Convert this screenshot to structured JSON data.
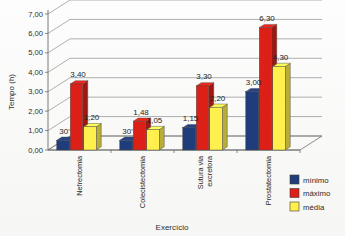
{
  "chart_data": {
    "type": "bar",
    "title": "",
    "xlabel": "Exercício",
    "ylabel": "Tempo (h)",
    "ylim": [
      0,
      7
    ],
    "ytick_step": 1,
    "ytick_labels": [
      "0,00",
      "1,00",
      "2,00",
      "3,00",
      "4,00",
      "5,00",
      "6,00",
      "7,00"
    ],
    "grid": true,
    "style": "3d-clustered-column",
    "legend_position": "bottom-right",
    "categories": [
      "Nefrectomia",
      "Colecistectomia",
      "Sutura via excretora",
      "Prostatectomia"
    ],
    "category_lines": [
      [
        "Nefrectomia"
      ],
      [
        "Colecistectomia"
      ],
      [
        "Sutura via",
        "excretora"
      ],
      [
        "Prostatectomia"
      ]
    ],
    "series": [
      {
        "name": "mínimo",
        "color": "#1F3D7A",
        "values": [
          0.5,
          0.5,
          1.15,
          3.0
        ],
        "labels": [
          "30'",
          "30'",
          "1,15",
          "3,00"
        ]
      },
      {
        "name": "máximo",
        "color": "#DD2017",
        "values": [
          3.4,
          1.48,
          3.3,
          6.3
        ],
        "labels": [
          "3,40",
          "1,48",
          "3,30",
          "6,30"
        ]
      },
      {
        "name": "média",
        "color": "#FFF04D",
        "values": [
          1.2,
          1.05,
          2.2,
          4.3
        ],
        "labels": [
          "1,20",
          "1,05",
          "2,20",
          "4,30"
        ]
      }
    ]
  },
  "colors": {
    "minimo": "#1F3D7A",
    "maximo": "#DD2017",
    "media": "#FFF04D",
    "gridline": "#8e8e8e",
    "axis": "#6b6b6b",
    "background": "#fdfdfd"
  },
  "legend": {
    "items": [
      {
        "label": "mínimo",
        "color": "#1F3D7A"
      },
      {
        "label": "máximo",
        "color": "#DD2017"
      },
      {
        "label": "média",
        "color": "#FFF04D"
      }
    ]
  },
  "axes": {
    "y_title": "Tempo (h)",
    "x_title": "Exercício"
  }
}
